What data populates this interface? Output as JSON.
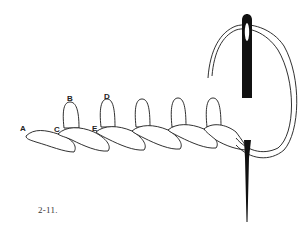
{
  "figure": {
    "type": "embroidery stitch diagram",
    "caption": "2-11.",
    "point_labels": [
      "A",
      "B",
      "C",
      "D",
      "E"
    ],
    "colors": {
      "ink": "#1a1a1a",
      "background": "#ffffff"
    }
  }
}
